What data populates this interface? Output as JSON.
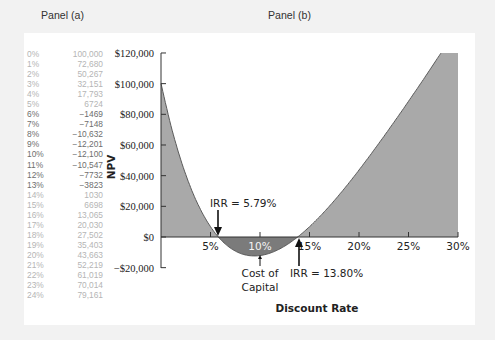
{
  "panels": {
    "a_title": "Panel (a)",
    "b_title": "Panel (b)"
  },
  "table": [
    {
      "rate": "0%",
      "npv": "100,000",
      "sign": "pos"
    },
    {
      "rate": "1%",
      "npv": "72,680",
      "sign": "pos"
    },
    {
      "rate": "2%",
      "npv": "50,267",
      "sign": "pos"
    },
    {
      "rate": "3%",
      "npv": "32,151",
      "sign": "pos"
    },
    {
      "rate": "4%",
      "npv": "17,793",
      "sign": "pos"
    },
    {
      "rate": "5%",
      "npv": "6724",
      "sign": "pos"
    },
    {
      "rate": "6%",
      "npv": "−1469",
      "sign": "neg"
    },
    {
      "rate": "7%",
      "npv": "−7148",
      "sign": "neg"
    },
    {
      "rate": "8%",
      "npv": "−10,632",
      "sign": "neg"
    },
    {
      "rate": "9%",
      "npv": "−12,201",
      "sign": "neg"
    },
    {
      "rate": "10%",
      "npv": "−12,100",
      "sign": "neg"
    },
    {
      "rate": "11%",
      "npv": "−10,547",
      "sign": "neg"
    },
    {
      "rate": "12%",
      "npv": "−7732",
      "sign": "neg"
    },
    {
      "rate": "13%",
      "npv": "−3823",
      "sign": "neg"
    },
    {
      "rate": "14%",
      "npv": "1030",
      "sign": "pos"
    },
    {
      "rate": "15%",
      "npv": "6698",
      "sign": "pos"
    },
    {
      "rate": "16%",
      "npv": "13,065",
      "sign": "pos"
    },
    {
      "rate": "17%",
      "npv": "20,030",
      "sign": "pos"
    },
    {
      "rate": "18%",
      "npv": "27,502",
      "sign": "pos"
    },
    {
      "rate": "19%",
      "npv": "35,403",
      "sign": "pos"
    },
    {
      "rate": "20%",
      "npv": "43,663",
      "sign": "pos"
    },
    {
      "rate": "21%",
      "npv": "52,219",
      "sign": "pos"
    },
    {
      "rate": "22%",
      "npv": "61,019",
      "sign": "pos"
    },
    {
      "rate": "23%",
      "npv": "70,014",
      "sign": "pos"
    },
    {
      "rate": "24%",
      "npv": "79,161",
      "sign": "pos"
    }
  ],
  "chart_data": {
    "type": "area",
    "title": "Panel (b)",
    "xlabel": "Discount Rate",
    "ylabel": "NPV",
    "x": [
      0,
      1,
      2,
      3,
      4,
      5,
      6,
      7,
      8,
      9,
      10,
      11,
      12,
      13,
      14,
      15,
      16,
      17,
      18,
      19,
      20,
      21,
      22,
      23,
      24
    ],
    "series": [
      {
        "name": "NPV",
        "values": [
          100000,
          72680,
          50267,
          32151,
          17793,
          6724,
          -1469,
          -7148,
          -10632,
          -12201,
          -12100,
          -10547,
          -7732,
          -3823,
          1030,
          6698,
          13065,
          20030,
          27502,
          35403,
          43663,
          52219,
          61019,
          70014,
          79161
        ]
      }
    ],
    "xlim": [
      0,
      30
    ],
    "ylim": [
      -20000,
      120000
    ],
    "xticks": [
      "5%",
      "10%",
      "15%",
      "20%",
      "25%",
      "30%"
    ],
    "yticks": [
      "$120,000",
      "$100,000",
      "$80,000",
      "$60,000",
      "$40,000",
      "$20,000",
      "$0",
      "−$20,000"
    ],
    "annotations": [
      {
        "text": "IRR = 5.79%",
        "x": 5.79,
        "y": 0
      },
      {
        "text": "IRR = 13.80%",
        "x": 13.8,
        "y": 0
      },
      {
        "text": "Cost of Capital",
        "x": 10,
        "y": -12100
      }
    ],
    "grid": false,
    "colors": {
      "positive_fill": "#a9a9a9",
      "negative_fill": "#7b7b7b",
      "line": "#555555"
    }
  },
  "labels": {
    "irr1": "IRR = 5.79%",
    "irr2": "IRR = 13.80%",
    "cost_of_capital_line1": "Cost of",
    "cost_of_capital_line2": "Capital"
  }
}
